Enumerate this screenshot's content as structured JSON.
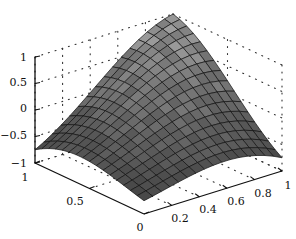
{
  "chart_data": {
    "type": "surface3d",
    "title": "",
    "xlabel": "",
    "ylabel": "",
    "zlabel": "",
    "x_ticks": [
      "0",
      "0.2",
      "0.4",
      "0.6",
      "0.8",
      "1"
    ],
    "y_ticks": [
      "0",
      "0.5",
      "1"
    ],
    "z_ticks": [
      "-1",
      "-0.5",
      "0",
      "0.5",
      "1"
    ],
    "xlim": [
      0,
      1
    ],
    "ylim": [
      0,
      1
    ],
    "zlim": [
      -1,
      1
    ],
    "grid": "dotted",
    "box": true,
    "colormap": "gray",
    "surface_function": "z ≈ sin(pi*x)*cos(pi*(y-x)/1) hump",
    "mesh": {
      "nx": 16,
      "ny": 16
    },
    "sample_points": [
      {
        "x": 0,
        "y": 1,
        "z": -0.7
      },
      {
        "x": 1,
        "y": 0,
        "z": -0.7
      },
      {
        "x": 1,
        "y": 1,
        "z": 1.0
      },
      {
        "x": 0,
        "y": 0,
        "z": -0.3
      }
    ]
  },
  "labels": {
    "z": [
      "1",
      "0.5",
      "0",
      "−0.5",
      "−1"
    ],
    "y": [
      "1",
      "0.5",
      "0"
    ],
    "x": [
      "0.2",
      "0.4",
      "0.6",
      "0.8",
      "1"
    ]
  }
}
